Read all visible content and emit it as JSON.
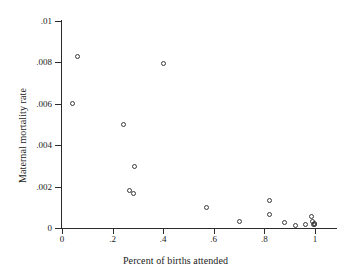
{
  "chart_data": {
    "type": "scatter",
    "title": "",
    "xlabel": "Percent of births attended",
    "ylabel": "Maternal mortality rate",
    "xlim": [
      0,
      1.04
    ],
    "ylim": [
      0,
      0.01
    ],
    "grid": false,
    "legend": null,
    "xticks": [
      0,
      0.2,
      0.4,
      0.6,
      0.8,
      1
    ],
    "xticklabels": [
      "0",
      ".2",
      ".4",
      ".6",
      ".8",
      "1"
    ],
    "yticks": [
      0,
      0.002,
      0.004,
      0.006,
      0.008,
      0.01
    ],
    "yticklabels": [
      "0",
      ".002",
      ".004",
      ".006",
      ".008",
      ".01"
    ],
    "marker": "open-circle",
    "marker_color": "#3a3a3a",
    "points": [
      {
        "x": 0.06,
        "y": 0.0083
      },
      {
        "x": 0.042,
        "y": 0.006
      },
      {
        "x": 0.243,
        "y": 0.00498
      },
      {
        "x": 0.402,
        "y": 0.00795
      },
      {
        "x": 0.285,
        "y": 0.00297
      },
      {
        "x": 0.268,
        "y": 0.00183
      },
      {
        "x": 0.281,
        "y": 0.00168
      },
      {
        "x": 0.57,
        "y": 0.00098
      },
      {
        "x": 0.702,
        "y": 0.0003
      },
      {
        "x": 0.822,
        "y": 0.00133
      },
      {
        "x": 0.822,
        "y": 0.00065
      },
      {
        "x": 0.878,
        "y": 0.00025
      },
      {
        "x": 0.923,
        "y": 0.00014
      },
      {
        "x": 0.962,
        "y": 0.00018
      },
      {
        "x": 0.988,
        "y": 0.00057
      },
      {
        "x": 0.991,
        "y": 0.00029
      },
      {
        "x": 0.994,
        "y": 0.00019
      },
      {
        "x": 0.998,
        "y": 0.00015
      },
      {
        "x": 1.0,
        "y": 0.00021
      }
    ]
  },
  "artifact": {
    "text": "",
    "visible": true
  }
}
